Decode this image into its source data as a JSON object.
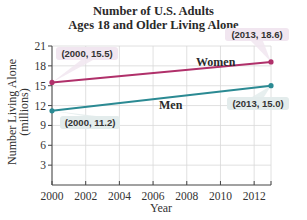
{
  "chart_data": {
    "type": "line",
    "title": "Number of U.S. Adults",
    "subtitle": "Ages 18 and Older Living Alone",
    "xlabel": "Year",
    "ylabel": "Number Living Alone",
    "ylabel_units": "(millions)",
    "xlim": [
      2000,
      2013
    ],
    "ylim": [
      0,
      21
    ],
    "x_ticks": [
      2000,
      2002,
      2004,
      2006,
      2008,
      2010,
      2012
    ],
    "y_ticks": [
      3,
      6,
      9,
      12,
      15,
      18,
      21
    ],
    "grid": true,
    "series": [
      {
        "name": "Women",
        "color": "#b0306a",
        "x": [
          2000,
          2013
        ],
        "values": [
          15.5,
          18.6
        ],
        "callouts": [
          "(2000, 15.5)",
          "(2013, 18.6)"
        ],
        "callout_bg": "#f1e6f0"
      },
      {
        "name": "Men",
        "color": "#2b8a93",
        "x": [
          2000,
          2013
        ],
        "values": [
          11.2,
          15.0
        ],
        "callouts": [
          "(2000, 11.2)",
          "(2013, 15.0)"
        ],
        "callout_bg": "#e3ecec"
      }
    ]
  }
}
